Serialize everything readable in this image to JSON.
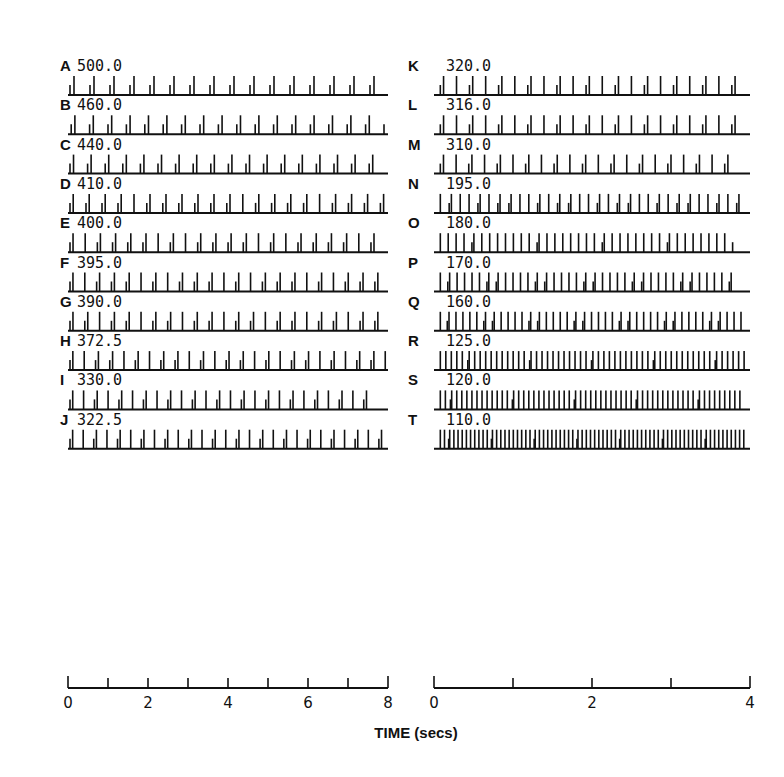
{
  "chart_data": [
    {
      "type": "raster",
      "panel": "left",
      "title": "",
      "xlabel": "TIME (secs)",
      "x_range": [
        0,
        8
      ],
      "x_ticks": [
        0,
        1,
        2,
        3,
        4,
        5,
        6,
        7,
        8
      ],
      "x_tick_labels": [
        "0",
        "2",
        "4",
        "6",
        "8"
      ],
      "x_tick_label_positions": [
        0,
        2,
        4,
        6,
        8
      ],
      "rows": [
        {
          "letter": "A",
          "value": "500.0",
          "period": 0.5,
          "pattern": [
            "s",
            "l"
          ],
          "start": 0.05,
          "end": 7.75
        },
        {
          "letter": "B",
          "value": "460.0",
          "period": 0.46,
          "pattern": [
            "s",
            "l"
          ],
          "start": 0.08,
          "end": 7.9
        },
        {
          "letter": "C",
          "value": "440.0",
          "period": 0.44,
          "pattern": [
            "s",
            "l"
          ],
          "start": 0.05,
          "end": 7.7
        },
        {
          "letter": "D",
          "value": "410.0",
          "period": 0.4,
          "pattern": [
            "s",
            "l",
            "s",
            "l",
            "s",
            "l",
            "s",
            "l",
            "l",
            "s",
            "l",
            "s",
            "l",
            "s",
            "l",
            "s",
            "l",
            "s",
            "l",
            "s",
            "l",
            "l"
          ],
          "start": 0.05,
          "end": 7.95
        },
        {
          "letter": "E",
          "value": "400.0",
          "period": 0.38,
          "pattern": [
            "s",
            "l",
            "l",
            "s",
            "l",
            "s",
            "l",
            "s",
            "l",
            "s",
            "l",
            "l"
          ],
          "start": 0.05,
          "end": 7.7
        },
        {
          "letter": "F",
          "value": "395.0",
          "period": 0.37,
          "pattern": [
            "s",
            "l",
            "l",
            "s",
            "l",
            "s",
            "l",
            "s",
            "l",
            "l"
          ],
          "start": 0.05,
          "end": 7.95
        },
        {
          "letter": "G",
          "value": "390.0",
          "period": 0.37,
          "pattern": [
            "s",
            "l",
            "s",
            "l",
            "l",
            "s",
            "l",
            "s",
            "l",
            "l"
          ],
          "start": 0.05,
          "end": 7.95
        },
        {
          "letter": "H",
          "value": "372.5",
          "period": 0.355,
          "pattern": [
            "s",
            "l",
            "l",
            "s",
            "l",
            "s",
            "l",
            "l"
          ],
          "start": 0.05,
          "end": 7.95
        },
        {
          "letter": "I",
          "value": "330.0",
          "period": 0.34,
          "pattern": [
            "s",
            "l",
            "l",
            "s",
            "l",
            "l"
          ],
          "start": 0.05,
          "end": 7.7
        },
        {
          "letter": "J",
          "value": "322.5",
          "period": 0.33,
          "pattern": [
            "s",
            "l",
            "l",
            "s",
            "l",
            "l"
          ],
          "start": 0.05,
          "end": 7.95
        }
      ]
    },
    {
      "type": "raster",
      "panel": "right",
      "title": "",
      "xlabel": "TIME (secs)",
      "x_range": [
        0,
        4
      ],
      "x_ticks": [
        0,
        1,
        2,
        3,
        4
      ],
      "x_tick_labels": [
        "0",
        "2",
        "4"
      ],
      "x_tick_label_positions": [
        0,
        2,
        4
      ],
      "rows": [
        {
          "letter": "K",
          "value": "320.0",
          "period": 0.205,
          "pattern": [
            "s",
            "l",
            "l",
            "s",
            "l",
            "l"
          ],
          "start": 0.08,
          "end": 3.95
        },
        {
          "letter": "L",
          "value": "316.0",
          "period": 0.205,
          "pattern": [
            "s",
            "l",
            "l",
            "s",
            "l",
            "l"
          ],
          "start": 0.08,
          "end": 3.95
        },
        {
          "letter": "M",
          "value": "310.0",
          "period": 0.2,
          "pattern": [
            "s",
            "l",
            "l",
            "s",
            "l",
            "l"
          ],
          "start": 0.08,
          "end": 3.85
        },
        {
          "letter": "N",
          "value": "195.0",
          "period": 0.14,
          "pattern": [
            "l",
            "s",
            "l",
            "l",
            "l",
            "s",
            "l",
            "l",
            "s"
          ],
          "start": 0.08,
          "end": 3.95
        },
        {
          "letter": "O",
          "value": "180.0",
          "period": 0.125,
          "pattern": [
            "l",
            "l",
            "l",
            "l",
            "s",
            "l",
            "l",
            "l",
            "l"
          ],
          "start": 0.08,
          "end": 3.8
        },
        {
          "letter": "P",
          "value": "170.0",
          "period": 0.118,
          "pattern": [
            "l",
            "s",
            "l",
            "l",
            "l",
            "l",
            "l",
            "s"
          ],
          "start": 0.08,
          "end": 3.85
        },
        {
          "letter": "Q",
          "value": "160.0",
          "period": 0.11,
          "pattern": [
            "l",
            "s",
            "l",
            "l",
            "l",
            "l",
            "l",
            "s"
          ],
          "start": 0.08,
          "end": 3.95
        },
        {
          "letter": "R",
          "value": "125.0",
          "period": 0.087,
          "pattern": [
            "l",
            "l",
            "l",
            "l",
            "l",
            "s",
            "l",
            "l",
            "l",
            "l",
            "l",
            "l"
          ],
          "start": 0.08,
          "end": 3.95
        },
        {
          "letter": "S",
          "value": "120.0",
          "period": 0.08,
          "pattern": [
            "l",
            "l",
            "s",
            "l",
            "l",
            "l",
            "l",
            "l",
            "l",
            "l",
            "l",
            "l",
            "l"
          ],
          "start": 0.08,
          "end": 3.9
        },
        {
          "letter": "T",
          "value": "110.0",
          "period": 0.066,
          "pattern": [
            "l",
            "l",
            "s",
            "l",
            "l",
            "l",
            "l",
            "l",
            "l",
            "l",
            "l"
          ],
          "start": 0.08,
          "end": 3.95
        }
      ]
    }
  ],
  "figure": {
    "xlabel": "TIME (secs)",
    "colors": {
      "ink": "#111111",
      "background": "#ffffff"
    }
  }
}
